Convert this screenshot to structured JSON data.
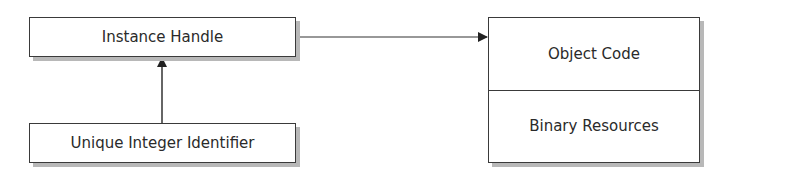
{
  "diagram": {
    "nodes": {
      "instance_handle": {
        "label": "Instance Handle"
      },
      "unique_integer_identifier": {
        "label": "Unique Integer Identifier"
      },
      "module": {
        "sections": [
          {
            "label": "Object Code"
          },
          {
            "label": "Binary Resources"
          }
        ]
      }
    },
    "edges": [
      {
        "from": "unique_integer_identifier",
        "to": "instance_handle",
        "type": "arrow"
      },
      {
        "from": "instance_handle",
        "to": "module",
        "type": "arrow"
      }
    ]
  }
}
